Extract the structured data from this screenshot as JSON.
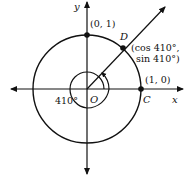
{
  "figure": {
    "type": "unit-circle-angle-diagram",
    "axes": {
      "x_label": "x",
      "y_label": "y",
      "origin_label": "O"
    },
    "points": {
      "top": {
        "label": "(0, 1)"
      },
      "D": {
        "name": "D",
        "coord_line1": "(cos 410°,",
        "coord_line2": "sin 410°)"
      },
      "C": {
        "name": "C",
        "coord": "(1, 0)"
      }
    },
    "angle": {
      "label": "410°",
      "degrees": 410
    },
    "colors": {
      "stroke": "#111111",
      "background": "#ffffff"
    }
  }
}
